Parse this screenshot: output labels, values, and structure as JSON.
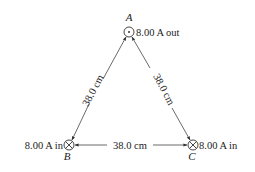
{
  "diagram": {
    "type": "three parallel wires at vertices of equilateral triangle",
    "nodes": [
      {
        "id": "A",
        "label": "A",
        "current": "8.00 A out",
        "direction": "out",
        "symbol": "dot-in-circle"
      },
      {
        "id": "B",
        "label": "B",
        "current": "8.00 A in",
        "direction": "in",
        "symbol": "x-in-circle"
      },
      {
        "id": "C",
        "label": "C",
        "current": "8.00 A in",
        "direction": "in",
        "symbol": "x-in-circle"
      }
    ],
    "edges": [
      {
        "from": "A",
        "to": "B",
        "label": "38.0 cm"
      },
      {
        "from": "A",
        "to": "C",
        "label": "38.0 cm"
      },
      {
        "from": "B",
        "to": "C",
        "label": "38.0 cm"
      }
    ],
    "colors": {
      "line": "#444444",
      "text": "#222222",
      "background": "#ffffff"
    }
  }
}
